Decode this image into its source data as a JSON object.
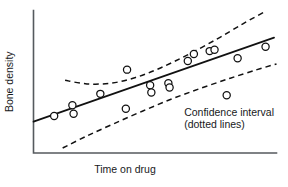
{
  "chart_data": {
    "type": "scatter",
    "title": "",
    "subtitle": "",
    "xlabel": "Time on drug",
    "ylabel": "Bone density",
    "xlim": [
      0,
      100
    ],
    "ylim": [
      0,
      100
    ],
    "grid": false,
    "axis_ticks": false,
    "legend": null,
    "legend_position": "none",
    "colors": {
      "point_stroke": "#111111",
      "point_fill": "#ffffff",
      "fit_line": "#111111",
      "confidence_band": "#111111",
      "axis": "#555a5e",
      "text": "#17191b",
      "background": "#ffffff"
    },
    "annotations": [
      {
        "name": "confidence-interval-label",
        "lines": [
          "Confidence interval",
          "(dotted lines)"
        ],
        "x": 62,
        "y": 26
      }
    ],
    "series": [
      {
        "name": "Observations",
        "marker": "open-circle",
        "points": [
          {
            "x": 8.5,
            "y": 26.0
          },
          {
            "x": 16.0,
            "y": 33.5
          },
          {
            "x": 16.5,
            "y": 27.5
          },
          {
            "x": 27.5,
            "y": 41.5
          },
          {
            "x": 38.0,
            "y": 31.0
          },
          {
            "x": 38.5,
            "y": 58.5
          },
          {
            "x": 48.0,
            "y": 47.5
          },
          {
            "x": 48.5,
            "y": 42.5
          },
          {
            "x": 55.5,
            "y": 49.0
          },
          {
            "x": 56.0,
            "y": 46.0
          },
          {
            "x": 63.5,
            "y": 64.5
          },
          {
            "x": 66.0,
            "y": 69.5
          },
          {
            "x": 72.5,
            "y": 71.5
          },
          {
            "x": 74.5,
            "y": 72.5
          },
          {
            "x": 79.5,
            "y": 40.5
          },
          {
            "x": 84.0,
            "y": 66.5
          },
          {
            "x": 95.5,
            "y": 74.5
          }
        ]
      }
    ],
    "fit_line": {
      "name": "Regression line",
      "style": "solid",
      "x_start": 0.0,
      "y_start": 22.0,
      "x_end": 99.0,
      "y_end": 81.0
    },
    "confidence_bands": [
      {
        "name": "upper-confidence-band",
        "style": "dashed",
        "points": [
          {
            "x": 13.0,
            "y": 51.0
          },
          {
            "x": 22.0,
            "y": 48.5
          },
          {
            "x": 32.0,
            "y": 49.0
          },
          {
            "x": 42.0,
            "y": 53.0
          },
          {
            "x": 52.0,
            "y": 59.5
          },
          {
            "x": 63.0,
            "y": 68.5
          },
          {
            "x": 75.0,
            "y": 79.5
          },
          {
            "x": 86.0,
            "y": 90.5
          },
          {
            "x": 95.0,
            "y": 99.0
          }
        ]
      },
      {
        "name": "lower-confidence-band",
        "style": "dashed",
        "points": [
          {
            "x": 12.0,
            "y": 3.5
          },
          {
            "x": 22.0,
            "y": 12.0
          },
          {
            "x": 33.0,
            "y": 20.5
          },
          {
            "x": 45.0,
            "y": 29.5
          },
          {
            "x": 57.0,
            "y": 38.0
          },
          {
            "x": 69.0,
            "y": 45.5
          },
          {
            "x": 81.0,
            "y": 52.5
          },
          {
            "x": 92.0,
            "y": 58.5
          },
          {
            "x": 100.0,
            "y": 62.5
          }
        ]
      }
    ]
  },
  "axes": {
    "y_label": "Bone density",
    "x_label": "Time on drug"
  },
  "annotation": {
    "line1": "Confidence interval",
    "line2": "(dotted lines)"
  }
}
